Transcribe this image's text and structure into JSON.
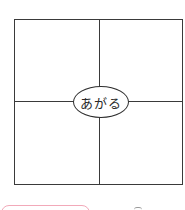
{
  "worksheet": {
    "center_word": "あがる",
    "grid": {
      "rows": 2,
      "cols": 2
    },
    "colors": {
      "line": "#3a3a3a",
      "pink_box_border": "#f2a9b9"
    }
  }
}
